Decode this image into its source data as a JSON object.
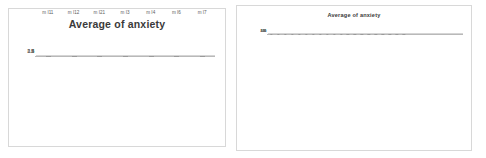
{
  "figure": {
    "background_color": "#ffffff",
    "panel_border_color": "#d8d8d8",
    "bar_color": "#808080",
    "error_bar_color": "#9a9a9a",
    "gridline_color": "#d5d5d5"
  },
  "chart_data": [
    {
      "id": "left-chart",
      "type": "bar",
      "title": "Average of anxiety",
      "xlabel": "",
      "ylabel": "",
      "ylim": [
        0,
        4
      ],
      "grid": true,
      "legend": "none",
      "ytick_labels": [
        "0",
        "0.5",
        "1",
        "1.5",
        "2",
        "2.5",
        "3",
        "3.5",
        "4"
      ],
      "ytick_values": [
        0,
        0.5,
        1,
        1.5,
        2,
        2.5,
        3,
        3.5,
        4
      ],
      "categories": [
        "m I11",
        "m I12",
        "m I21",
        "m I3",
        "m I4",
        "m I6",
        "m I7"
      ],
      "values": [
        2.25,
        1.4,
        1.25,
        1.5,
        1.05,
        1.45,
        1.1
      ],
      "error_low": [
        1.0,
        0.95,
        0.95,
        0.95,
        0.85,
        0.9,
        0.85
      ],
      "error_high": [
        3.55,
        2.1,
        1.75,
        2.2,
        1.45,
        2.3,
        1.55
      ]
    },
    {
      "id": "right-chart",
      "type": "bar",
      "title": "Average of anxiety",
      "xlabel": "",
      "ylabel": "",
      "ylim": [
        0,
        4.0
      ],
      "grid": true,
      "legend": "none",
      "ytick_labels": [
        "0.00",
        "0.50",
        "1.00",
        "1.50",
        "2.00",
        "2.50",
        "3.00",
        "3.50",
        "4.00"
      ],
      "ytick_values": [
        0,
        0.5,
        1.0,
        1.5,
        2.0,
        2.5,
        3.0,
        3.5,
        4.0
      ],
      "categories": [
        "Category 1",
        "Category 2",
        "Category 3",
        "Category 4",
        "Category 5",
        "Category 6",
        "Category 7",
        "Category 8",
        "Category 9",
        "Category 10",
        "Category 11",
        "Category 12",
        "Category 13",
        "Category 14",
        "Category 15",
        "Category 16",
        "Category 17",
        "Category 18",
        "Category 19",
        "Category 20",
        "Category 21",
        "Category 22",
        "Category 23",
        "Category 24",
        "Category 25",
        "Category 26",
        "Category 27",
        "Category 28"
      ],
      "values": [
        2.3,
        2.25,
        2.1,
        1.8,
        1.75,
        1.5,
        1.5,
        2.0,
        1.7,
        1.7,
        1.65,
        1.6,
        1.6,
        1.6,
        1.55,
        1.55,
        1.55,
        1.7,
        1.45,
        1.4,
        1.0,
        1.0,
        1.0,
        1.0,
        1.0,
        1.0,
        1.0,
        1.0
      ],
      "error_low": [
        1.55,
        1.5,
        1.45,
        1.3,
        1.25,
        1.2,
        1.15,
        1.4,
        1.25,
        1.25,
        1.2,
        1.2,
        1.2,
        1.2,
        1.15,
        1.15,
        1.15,
        1.25,
        1.1,
        1.05,
        1.0,
        1.0,
        1.0,
        1.0,
        1.0,
        1.0,
        1.0,
        1.0
      ],
      "error_high": [
        3.8,
        3.8,
        2.9,
        2.5,
        3.2,
        2.1,
        2.05,
        2.6,
        2.2,
        2.3,
        2.1,
        2.2,
        2.25,
        2.2,
        2.05,
        2.1,
        2.05,
        2.3,
        1.95,
        1.8,
        1.0,
        1.0,
        1.0,
        1.0,
        1.0,
        1.0,
        1.0,
        1.0
      ]
    }
  ]
}
